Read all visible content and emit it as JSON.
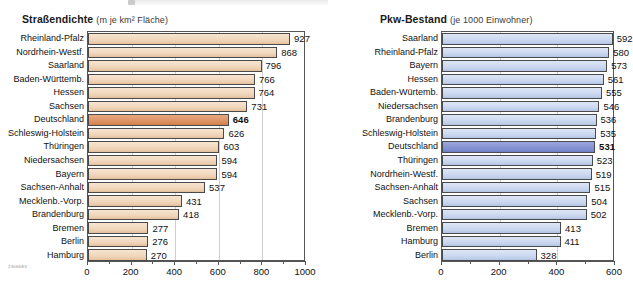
{
  "corner_code": "23066EX",
  "colors": {
    "bar_orange": "#eed7bb",
    "bar_orange_highlight": "#dd8f5e",
    "bar_blue": "#cdd9ef",
    "bar_blue_highlight": "#8290d2",
    "frame": "#555555",
    "grid": "#cfcfcf"
  },
  "chart_data": [
    {
      "type": "bar",
      "orientation": "horizontal",
      "title": "Straßendichte",
      "subtitle": "(m je km² Fläche)",
      "xlabel": "",
      "ylabel": "",
      "xlim": [
        0,
        1000
      ],
      "xticks": [
        0,
        200,
        400,
        600,
        800,
        1000
      ],
      "xtick_labels": [
        "0",
        "200",
        "400",
        "600",
        "800",
        "1000"
      ],
      "minor_ticks": [
        100,
        300,
        500,
        700,
        900
      ],
      "grid": true,
      "legend": "none",
      "highlight_category": "Deutschland",
      "categories": [
        "Rheinland-Pfalz",
        "Nordrhein-Westf.",
        "Saarland",
        "Baden-Württemb.",
        "Hessen",
        "Sachsen",
        "Deutschland",
        "Schleswig-Holstein",
        "Thüringen",
        "Niedersachsen",
        "Bayern",
        "Sachsen-Anhalt",
        "Mecklenb.-Vorp.",
        "Brandenburg",
        "Bremen",
        "Berlin",
        "Hamburg"
      ],
      "values": [
        927,
        868,
        796,
        766,
        764,
        731,
        646,
        626,
        603,
        594,
        594,
        537,
        431,
        418,
        277,
        276,
        270
      ]
    },
    {
      "type": "bar",
      "orientation": "horizontal",
      "title": "Pkw-Bestand",
      "subtitle": "(je 1000 Einwohner)",
      "xlabel": "",
      "ylabel": "",
      "xlim": [
        0,
        600
      ],
      "xticks": [
        0,
        200,
        400,
        600
      ],
      "xtick_labels": [
        "0",
        "200",
        "400",
        "600"
      ],
      "minor_ticks": [
        100,
        300,
        500
      ],
      "grid": true,
      "legend": "none",
      "highlight_category": "Deutschland",
      "categories": [
        "Saarland",
        "Rheinland-Pfalz",
        "Bayern",
        "Hessen",
        "Baden-Würtemb.",
        "Niedersachsen",
        "Brandenburg",
        "Schleswig-Holstein",
        "Deutschland",
        "Thüringen",
        "Nordrhein-Westf.",
        "Sachsen-Anhalt",
        "Sachsen",
        "Mecklenb.-Vorp.",
        "Bremen",
        "Hamburg",
        "Berlin"
      ],
      "values": [
        592,
        580,
        573,
        561,
        555,
        546,
        536,
        535,
        531,
        523,
        519,
        515,
        504,
        502,
        413,
        411,
        328
      ]
    }
  ]
}
